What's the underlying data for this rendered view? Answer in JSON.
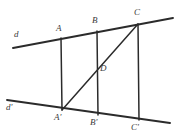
{
  "figure": {
    "kind": "plane-geometry-diagram",
    "background_color": "#ffffff",
    "stroke_color": "#2b2b2b",
    "label_color": "#3a3a3a"
  },
  "lines": [
    {
      "name": "line-d",
      "label": "d",
      "label_x": 14,
      "label_y": 30,
      "x1": 13,
      "y1": 48,
      "x2": 173,
      "y2": 18,
      "width": 1.9
    },
    {
      "name": "line-d-prime",
      "label": "d'",
      "label_x": 6,
      "label_y": 103,
      "x1": 7,
      "y1": 100,
      "x2": 170,
      "y2": 123,
      "width": 1.9
    }
  ],
  "segments": [
    {
      "name": "segment-AA-prime",
      "from": "A",
      "to": "A'",
      "x1": 61,
      "y1": 38,
      "x2": 62,
      "y2": 110,
      "width": 1.5
    },
    {
      "name": "segment-BB-prime",
      "from": "B",
      "to": "B'",
      "x1": 97,
      "y1": 31,
      "x2": 98,
      "y2": 115,
      "width": 1.5
    },
    {
      "name": "segment-CC-prime",
      "from": "C",
      "to": "C'",
      "x1": 138,
      "y1": 24,
      "x2": 139,
      "y2": 120,
      "width": 1.5
    },
    {
      "name": "segment-A-prime-C-diagonal",
      "from": "A'",
      "to": "C",
      "x1": 62,
      "y1": 110,
      "x2": 138,
      "y2": 24,
      "width": 1.5
    }
  ],
  "points": [
    {
      "name": "point-A",
      "label": "A",
      "x": 61,
      "y": 38,
      "label_x": 56,
      "label_y": 24
    },
    {
      "name": "point-B",
      "label": "B",
      "x": 97,
      "y": 31,
      "label_x": 92,
      "label_y": 16
    },
    {
      "name": "point-C",
      "label": "C",
      "x": 138,
      "y": 24,
      "label_x": 134,
      "label_y": 8
    },
    {
      "name": "point-D",
      "label": "D",
      "x": 98,
      "y": 68,
      "label_x": 100,
      "label_y": 64
    },
    {
      "name": "point-A-prime",
      "label": "A'",
      "x": 62,
      "y": 110,
      "label_x": 54,
      "label_y": 113
    },
    {
      "name": "point-B-prime",
      "label": "B'",
      "x": 98,
      "y": 115,
      "label_x": 90,
      "label_y": 118
    },
    {
      "name": "point-C-prime",
      "label": "C'",
      "x": 139,
      "y": 120,
      "label_x": 131,
      "label_y": 123
    }
  ]
}
